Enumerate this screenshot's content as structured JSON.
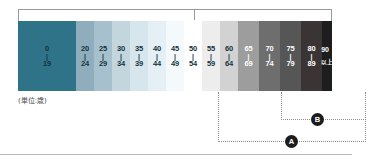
{
  "figure": {
    "unit_caption": "(単位:歳)",
    "top_bracket": {
      "present": true
    }
  },
  "chart_data": {
    "type": "bar",
    "title": "",
    "subtitle": "",
    "xlabel": "",
    "ylabel": "",
    "legend_position": "none",
    "grid": false,
    "categories": [
      "0-19",
      "20-24",
      "25-29",
      "30-34",
      "35-39",
      "40-44",
      "45-49",
      "50-54",
      "55-59",
      "60-64",
      "65-69",
      "70-74",
      "75-79",
      "80-89",
      "90以上"
    ],
    "bands": [
      {
        "from": "0",
        "dash": "|",
        "to": "19",
        "color": "#2f7389",
        "ink": "dark",
        "width": 58
      },
      {
        "from": "20",
        "dash": "|",
        "to": "24",
        "color": "#8fadbd",
        "ink": "dark",
        "width": 18
      },
      {
        "from": "25",
        "dash": "|",
        "to": "29",
        "color": "#a6c0cd",
        "ink": "dark",
        "width": 18
      },
      {
        "from": "30",
        "dash": "|",
        "to": "34",
        "color": "#c3d6de",
        "ink": "dark",
        "width": 18
      },
      {
        "from": "35",
        "dash": "|",
        "to": "39",
        "color": "#d6e6ec",
        "ink": "dark",
        "width": 18
      },
      {
        "from": "40",
        "dash": "|",
        "to": "44",
        "color": "#e4f0f5",
        "ink": "dark",
        "width": 18
      },
      {
        "from": "45",
        "dash": "|",
        "to": "49",
        "color": "#f4fafc",
        "ink": "dark",
        "width": 18
      },
      {
        "from": "50",
        "dash": "|",
        "to": "54",
        "color": "#ffffff",
        "ink": "dark",
        "width": 18
      },
      {
        "from": "55",
        "dash": "|",
        "to": "59",
        "color": "#ededed",
        "ink": "dark",
        "width": 18
      },
      {
        "from": "60",
        "dash": "|",
        "to": "64",
        "color": "#d2d2d2",
        "ink": "dark",
        "width": 18
      },
      {
        "from": "65",
        "dash": "|",
        "to": "69",
        "color": "#9d9d9d",
        "ink": "light",
        "width": 21
      },
      {
        "from": "70",
        "dash": "|",
        "to": "74",
        "color": "#6e6e6e",
        "ink": "light",
        "width": 21
      },
      {
        "from": "75",
        "dash": "|",
        "to": "79",
        "color": "#565656",
        "ink": "light",
        "width": 21
      },
      {
        "from": "80",
        "dash": "|",
        "to": "89",
        "color": "#3a3434",
        "ink": "light",
        "width": 21
      },
      {
        "from": "90",
        "dash": "",
        "to": "以上",
        "color": "#1d1d1d",
        "ink": "light",
        "width": 10
      }
    ],
    "values": [
      19,
      24,
      29,
      34,
      39,
      44,
      49,
      54,
      59,
      64,
      69,
      74,
      79,
      89,
      90
    ]
  },
  "callouts": [
    {
      "id": "A",
      "label": "A",
      "spans": "55-59 through 90以上"
    },
    {
      "id": "B",
      "label": "B",
      "spans": "70-74 through 90以上"
    }
  ],
  "colors": {
    "young_accent": "#2f7389",
    "old_accent": "#1d1d1d",
    "marker_fill": "#1c1c1c",
    "bracket_rule": "#9a9a9a"
  }
}
